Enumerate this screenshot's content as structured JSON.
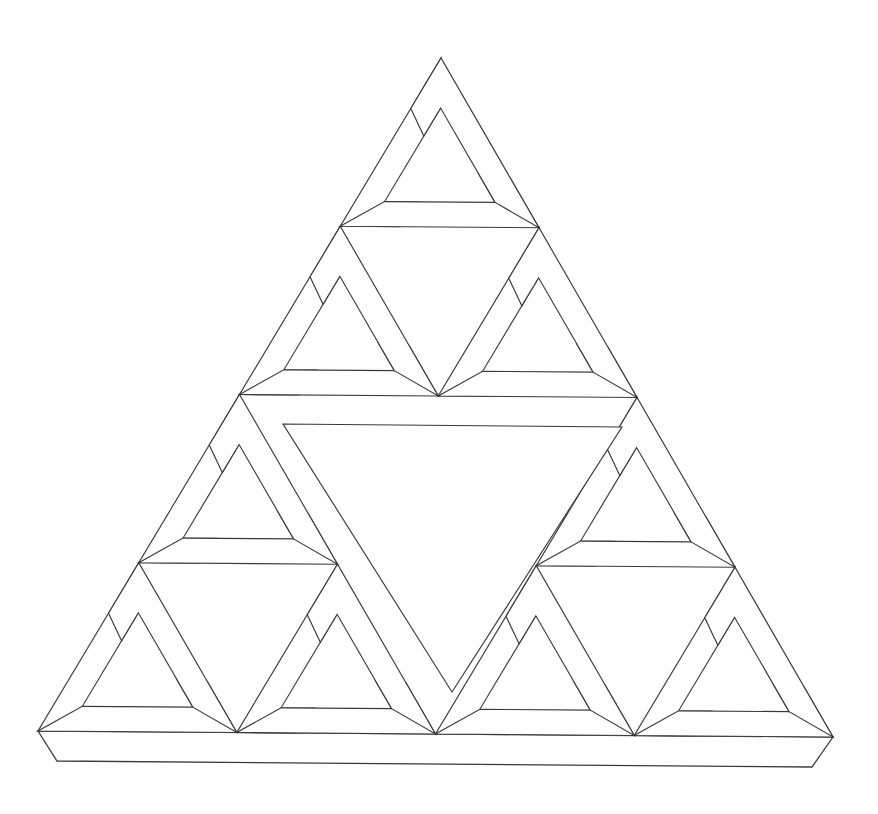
{
  "document": {
    "title": "Recursive Impossible (Penrose) Triangle",
    "subject": "Sierpinski-style arrangement of Penrose impossible triangles",
    "medium": "line drawing",
    "background_color": "#ffffff",
    "line_color": "#3a3a3a",
    "line_width": 1.15,
    "canvas": {
      "width": 878,
      "height": 814
    }
  },
  "figure": {
    "name": "recursive-penrose-triangle",
    "recursion_depth": 3,
    "sub_triangles_per_level": 3,
    "total_leaf_triangles": 9,
    "orientation": "apex-up",
    "has_3d_extrusion_base": true,
    "outer_triangle": {
      "apex_top": {
        "x": 441,
        "y": 58
      },
      "corner_bottom_left": {
        "x": 38,
        "y": 731
      },
      "corner_bottom_right": {
        "x": 833,
        "y": 737
      },
      "base_width": 795,
      "height": 679
    },
    "extrusion": {
      "name": "base-slab",
      "depth_x": 19,
      "depth_y": 30,
      "bottom_left": {
        "x": 57,
        "y": 761
      },
      "bottom_right": {
        "x": 812,
        "y": 767
      }
    },
    "bar_width_ratio": 0.148,
    "central_void": {
      "shape": "inverted-triangle",
      "top_left": {
        "x": 283,
        "y": 424
      },
      "top_right": {
        "x": 622,
        "y": 427
      },
      "apex_bottom": {
        "x": 452,
        "y": 692
      }
    },
    "colors": {
      "stroke": "#3a3a3a",
      "fill": "#ffffff",
      "page": "#ffffff"
    }
  },
  "geometry": {
    "note": "Penrose tribar unit built from three interlocking limbs; each limb is a parallelogram-ended bar. Rendered recursively at three scales.",
    "unit_bar_ratio": 0.225,
    "notch_ratio": 0.5
  }
}
